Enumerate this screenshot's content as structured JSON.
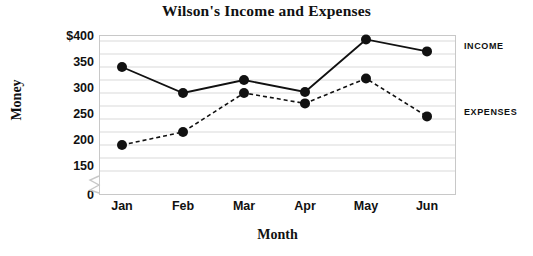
{
  "chart_data": {
    "type": "line",
    "title": "Wilson's Income and Expenses",
    "xlabel": "Month",
    "ylabel": "Money",
    "categories": [
      "Jan",
      "Feb",
      "Mar",
      "Apr",
      "May",
      "Jun"
    ],
    "series": [
      {
        "name": "INCOME",
        "style": "solid",
        "values": [
          350,
          300,
          325,
          302,
          403,
          380
        ]
      },
      {
        "name": "EXPENSES",
        "style": "dashed",
        "values": [
          200,
          225,
          300,
          280,
          328,
          255
        ]
      }
    ],
    "ylim": [
      150,
      410
    ],
    "y_tick_labels": [
      "$400",
      "350",
      "300",
      "250",
      "200",
      "150",
      "0"
    ],
    "y_tick_values": [
      400,
      350,
      300,
      250,
      200,
      150,
      0
    ],
    "gridlines": [
      400,
      375,
      350,
      325,
      300,
      275,
      250,
      225,
      200,
      175,
      150
    ],
    "grid": true,
    "axis_break": true,
    "axis_break_between": [
      150,
      0
    ],
    "legend_position": "right",
    "marker": "filled-circle",
    "colors": {
      "line": "#111111",
      "marker": "#111111",
      "grid": "#d9d9d9",
      "axis": "#c8c8c8",
      "text": "#111111"
    }
  },
  "legend": {
    "income_label": "INCOME",
    "expenses_label": "EXPENSES"
  }
}
